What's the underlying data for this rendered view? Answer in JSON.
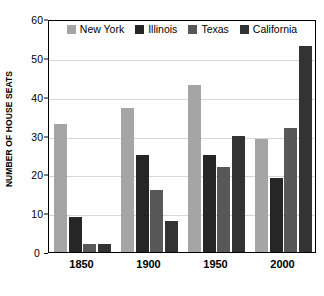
{
  "chart_data": {
    "type": "bar",
    "title": "",
    "subtitle": "",
    "xlabel": "",
    "ylabel": "NUMBER OF HOUSE SEATS",
    "categories": [
      "1850",
      "1900",
      "1950",
      "2000"
    ],
    "series": [
      {
        "name": "New York",
        "color": "#a5a5a5",
        "values": [
          33,
          37,
          43,
          29
        ]
      },
      {
        "name": "Illinois",
        "color": "#262626",
        "values": [
          9,
          25,
          25,
          19
        ]
      },
      {
        "name": "Texas",
        "color": "#585858",
        "values": [
          2,
          16,
          22,
          32
        ]
      },
      {
        "name": "California",
        "color": "#333333",
        "values": [
          2,
          8,
          30,
          53
        ]
      }
    ],
    "ylim": [
      0,
      60
    ],
    "yticks": [
      0,
      10,
      20,
      30,
      40,
      50,
      60
    ],
    "ytick_labels": [
      "0",
      "10",
      "20",
      "30",
      "40",
      "50",
      "60"
    ],
    "grid": true,
    "grid_axis": "y",
    "legend_position": "top-inside",
    "annotations": []
  },
  "legend": {
    "items": [
      {
        "label": "New York"
      },
      {
        "label": "Illinois"
      },
      {
        "label": "Texas"
      },
      {
        "label": "California"
      }
    ]
  },
  "axes": {
    "y_title": "NUMBER OF HOUSE SEATS",
    "y_labels": [
      "60",
      "50",
      "40",
      "30",
      "20",
      "10"
    ],
    "y_zero_label": "0",
    "x_labels": [
      "1850",
      "1900",
      "1950",
      "2000"
    ]
  }
}
